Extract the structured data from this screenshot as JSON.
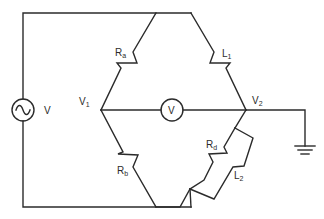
{
  "diagram": {
    "type": "AC bridge circuit",
    "source": {
      "label": "V",
      "symbol": "ac-sine"
    },
    "meter": {
      "label": "V"
    },
    "nodes": [
      {
        "id": "V1",
        "label": "V",
        "sub": "1"
      },
      {
        "id": "V2",
        "label": "V",
        "sub": "2"
      }
    ],
    "components": [
      {
        "id": "Ra",
        "label": "R",
        "sub": "a",
        "type": "resistor",
        "between": [
          "top",
          "V1"
        ]
      },
      {
        "id": "L1",
        "label": "L",
        "sub": "1",
        "type": "inductor",
        "between": [
          "top",
          "V2"
        ]
      },
      {
        "id": "Rb",
        "label": "R",
        "sub": "b",
        "type": "resistor",
        "between": [
          "V1",
          "bottom"
        ]
      },
      {
        "id": "Rd",
        "label": "R",
        "sub": "d",
        "type": "resistor",
        "between": [
          "V2",
          "bottom"
        ],
        "parallel_with": "L2"
      },
      {
        "id": "L2",
        "label": "L",
        "sub": "2",
        "type": "inductor",
        "between": [
          "V2",
          "bottom"
        ],
        "parallel_with": "Rd"
      }
    ],
    "ground": {
      "attached_to": "V2"
    },
    "colors": {
      "line": "#2b2b2b",
      "background": "#ffffff"
    }
  }
}
